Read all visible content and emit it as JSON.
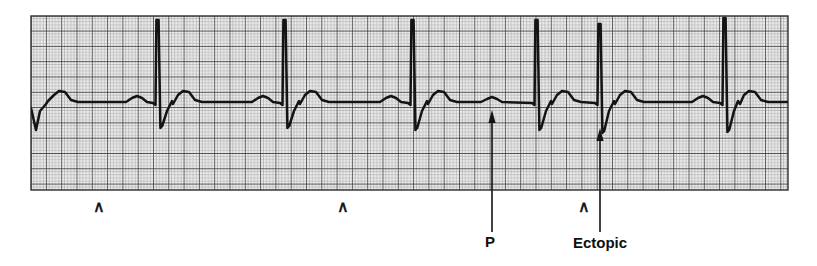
{
  "figure": {
    "type": "ecg-rhythm-strip",
    "background_color": "#ffffff",
    "trace_color": "#141414",
    "grid": {
      "x": 31,
      "y": 16,
      "width": 757,
      "height": 174,
      "fine_spacing_px": 3.06,
      "major_every": 5,
      "fine_color": "#8a8a8a",
      "major_color": "#2b2b2b",
      "paper_tint": "#ededed"
    }
  },
  "annotations": {
    "carets": [
      {
        "name": "caret-marker-1",
        "glyph": "∧",
        "x": 99,
        "y": 212
      },
      {
        "name": "caret-marker-2",
        "glyph": "∧",
        "x": 343,
        "y": 212
      },
      {
        "name": "caret-marker-3",
        "glyph": "∧",
        "x": 584,
        "y": 212
      }
    ],
    "callouts": [
      {
        "name": "p-wave-callout",
        "label": "P",
        "label_x": 490,
        "label_y": 247,
        "leader_x": 492,
        "leader_top": 110,
        "leader_bottom": 232,
        "arrow_tip_y": 110
      },
      {
        "name": "ectopic-callout",
        "label": "Ectopic",
        "label_x": 600,
        "label_y": 248,
        "leader_x": 600,
        "leader_top": 128,
        "leader_bottom": 232,
        "arrow_tip_y": 128
      }
    ]
  },
  "chart_data": {
    "type": "line",
    "title": "",
    "xlabel": "",
    "ylabel": "",
    "series_name": "ECG lead trace",
    "baseline_y_px": 102,
    "beats": [
      {
        "index": 1,
        "qrs_x": 34,
        "r_peak_y": 16,
        "s_trough_y": 130,
        "p_x": 0,
        "t_x": 62,
        "t_peak_y": 91,
        "p_peak_y": 0,
        "ectopic": false
      },
      {
        "index": 2,
        "qrs_x": 158,
        "r_peak_y": 20,
        "s_trough_y": 128,
        "p_x": 137,
        "t_x": 186,
        "t_peak_y": 91,
        "p_peak_y": 96,
        "ectopic": false
      },
      {
        "index": 3,
        "qrs_x": 285,
        "r_peak_y": 20,
        "s_trough_y": 128,
        "p_x": 263,
        "t_x": 313,
        "t_peak_y": 91,
        "p_peak_y": 96,
        "ectopic": false
      },
      {
        "index": 4,
        "qrs_x": 413,
        "r_peak_y": 20,
        "s_trough_y": 130,
        "p_x": 391,
        "t_x": 441,
        "t_peak_y": 91,
        "p_peak_y": 96,
        "ectopic": false
      },
      {
        "index": 5,
        "qrs_x": 537,
        "r_peak_y": 20,
        "s_trough_y": 130,
        "p_x": 492,
        "t_x": 565,
        "t_peak_y": 91,
        "p_peak_y": 97,
        "ectopic": false
      },
      {
        "index": 6,
        "qrs_x": 600,
        "r_peak_y": 24,
        "s_trough_y": 133,
        "p_x": 0,
        "t_x": 628,
        "t_peak_y": 91,
        "p_peak_y": 0,
        "ectopic": true
      },
      {
        "index": 7,
        "qrs_x": 725,
        "r_peak_y": 18,
        "s_trough_y": 132,
        "p_x": 703,
        "t_x": 752,
        "t_peak_y": 91,
        "p_peak_y": 96,
        "ectopic": false
      }
    ]
  }
}
